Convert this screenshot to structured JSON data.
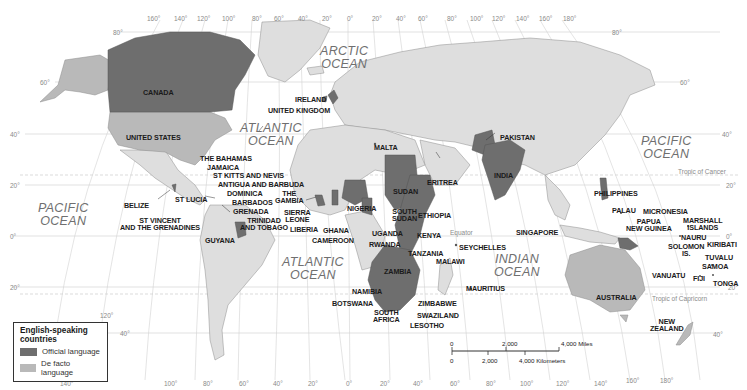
{
  "colors": {
    "official": "#6e6e6e",
    "de_facto": "#b9b9b9",
    "other_land": "#dedede",
    "water": "#ffffff",
    "grid": "#c9c9c9",
    "border": "#8c8c8c"
  },
  "legend": {
    "title_line1": "English-speaking",
    "title_line2": "countries",
    "items": [
      {
        "label": "Official language",
        "category": "official"
      },
      {
        "label": "De facto language",
        "category": "de_facto"
      }
    ]
  },
  "oceans": {
    "arctic": {
      "line1": "ARCTIC",
      "line2": "OCEAN"
    },
    "atlantic_north": {
      "line1": "ATLANTIC",
      "line2": "OCEAN"
    },
    "atlantic_south": {
      "line1": "ATLANTIC",
      "line2": "OCEAN"
    },
    "pacific_west": {
      "line1": "PACIFIC",
      "line2": "OCEAN"
    },
    "pacific_east": {
      "line1": "PACIFIC",
      "line2": "OCEAN"
    },
    "indian": {
      "line1": "INDIAN",
      "line2": "OCEAN"
    }
  },
  "reference_lines": {
    "equator": "Equator",
    "tropic_cancer": "Tropic of Cancer",
    "tropic_capricorn": "Tropic of Capricorn"
  },
  "longitude_top": [
    "160°",
    "140°",
    "120°",
    "100°",
    "80°",
    "60°",
    "40°",
    "20°",
    "0°",
    "20°",
    "40°",
    "60°",
    "80°",
    "100°",
    "120°",
    "140°",
    "160°",
    "180°"
  ],
  "longitude_bottom": [
    "140°",
    "120°",
    "100°",
    "80°",
    "60°",
    "40°",
    "20°",
    "0°",
    "20°",
    "40°",
    "60°",
    "80°",
    "100°",
    "120°",
    "140°",
    "160°",
    "180°"
  ],
  "latitude_left": [
    "80°",
    "60°",
    "40°",
    "20°",
    "0°",
    "20°",
    "40°"
  ],
  "latitude_right": [
    "80°",
    "60°",
    "40°",
    "20°",
    "0°",
    "20°",
    "40°"
  ],
  "countries": {
    "official": [
      "CANADA",
      "IRELAND",
      "UNITED KINGDOM",
      "MALTA",
      "PAKISTAN",
      "INDIA",
      "THE BAHAMAS",
      "JAMAICA",
      "ST KITTS AND NEVIS",
      "ANTIGUA AND BARBUDA",
      "DOMINICA",
      "ST LUCIA",
      "BARBADOS",
      "GRENADA",
      "ST VINCENT AND THE GRENADINES",
      "TRINIDAD AND TOBAGO",
      "BELIZE",
      "GUYANA",
      "THE GAMBIA",
      "SIERRA LEONE",
      "LIBERIA",
      "GHANA",
      "NIGERIA",
      "CAMEROON",
      "SUDAN",
      "SOUTH SUDAN",
      "ERITREA",
      "ETHIOPIA",
      "UGANDA",
      "KENYA",
      "RWANDA",
      "TANZANIA",
      "MALAWI",
      "ZAMBIA",
      "NAMIBIA",
      "BOTSWANA",
      "ZIMBABWE",
      "SOUTH AFRICA",
      "SWAZILAND",
      "LESOTHO",
      "SEYCHELLES",
      "MAURITIUS",
      "SINGAPORE",
      "PHILIPPINES",
      "PALAU",
      "MICRONESIA",
      "PAPUA NEW GUINEA",
      "MARSHALL ISLANDS",
      "NAURU",
      "SOLOMON IS.",
      "KIRIBATI",
      "TUVALU",
      "SAMOA",
      "VANUATU",
      "FIJI",
      "TONGA"
    ],
    "de_facto": [
      "UNITED STATES",
      "AUSTRALIA",
      "NEW ZEALAND"
    ]
  },
  "labels": {
    "canada": "CANADA",
    "united_states": "UNITED STATES",
    "ireland": "IRELAND",
    "united_kingdom": "UNITED KINGDOM",
    "malta": "MALTA",
    "pakistan": "PAKISTAN",
    "india": "INDIA",
    "bahamas": "THE BAHAMAS",
    "jamaica": "JAMAICA",
    "st_kitts": "ST KITTS AND NEVIS",
    "antigua": "ANTIGUA AND BARBUDA",
    "dominica": "DOMINICA",
    "st_lucia": "ST LUCIA",
    "barbados": "BARBADOS",
    "grenada": "GRENADA",
    "st_vincent_1": "ST VINCENT",
    "st_vincent_2": "AND THE GRENADINES",
    "trinidad_1": "TRINIDAD",
    "trinidad_2": "AND TOBAGO",
    "belize": "BELIZE",
    "guyana": "GUYANA",
    "gambia_1": "THE",
    "gambia_2": "GAMBIA",
    "sierra_leone_1": "SIERRA",
    "sierra_leone_2": "LEONE",
    "liberia": "LIBERIA",
    "ghana": "GHANA",
    "nigeria": "NIGERIA",
    "cameroon": "CAMEROON",
    "sudan": "SUDAN",
    "south_sudan_1": "SOUTH",
    "south_sudan_2": "SUDAN",
    "eritrea": "ERITREA",
    "ethiopia": "ETHIOPIA",
    "uganda": "UGANDA",
    "kenya": "KENYA",
    "rwanda": "RWANDA",
    "tanzania": "TANZANIA",
    "malawi": "MALAWI",
    "zambia": "ZAMBIA",
    "namibia": "NAMIBIA",
    "botswana": "BOTSWANA",
    "zimbabwe": "ZIMBABWE",
    "south_africa_1": "SOUTH",
    "south_africa_2": "AFRICA",
    "swaziland": "SWAZILAND",
    "lesotho": "LESOTHO",
    "seychelles": "SEYCHELLES",
    "mauritius": "MAURITIUS",
    "singapore": "SINGAPORE",
    "philippines": "PHILIPPINES",
    "palau": "PALAU",
    "micronesia": "MICRONESIA",
    "png_1": "PAPUA",
    "png_2": "NEW GUINEA",
    "marshall_1": "MARSHALL",
    "marshall_2": "ISLANDS",
    "nauru": "NAURU",
    "solomon_1": "SOLOMON",
    "solomon_2": "IS.",
    "kiribati": "KIRIBATI",
    "tuvalu": "TUVALU",
    "samoa": "SAMOA",
    "vanuatu": "VANUATU",
    "fiji": "FIJI",
    "tonga": "TONGA",
    "australia": "AUSTRALIA",
    "new_zealand_1": "NEW",
    "new_zealand_2": "ZEALAND"
  },
  "scale_bar": {
    "miles_0": "0",
    "miles_2000": "2,000",
    "miles_4000": "4,000 Miles",
    "km_0": "0",
    "km_2000": "2,000",
    "km_4000": "4,000 Kilometers"
  }
}
